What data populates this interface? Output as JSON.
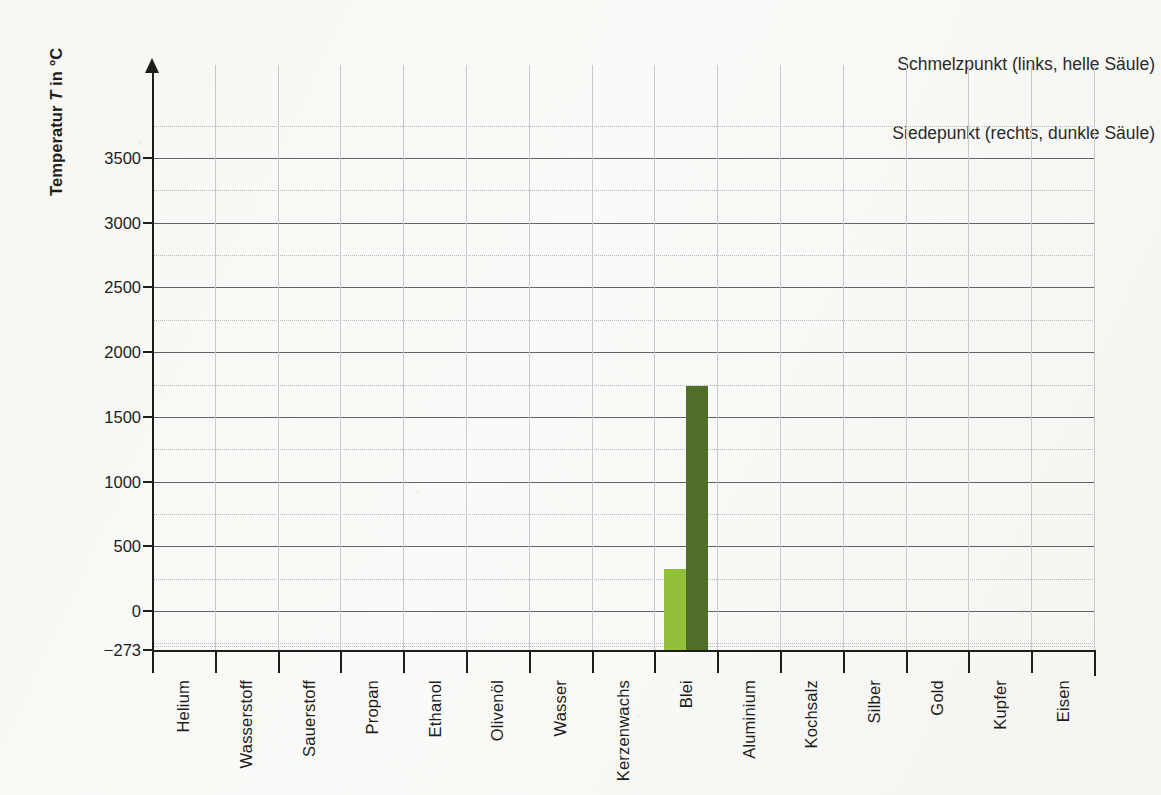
{
  "legend": {
    "line1": "Schmelzpunkt (links, helle Säule)",
    "line2": "Siedepunkt (rechts, dunkle Säule)"
  },
  "axis": {
    "y_title_prefix": "Temperatur ",
    "y_title_symbol": "T",
    "y_title_suffix": " in °C"
  },
  "colors": {
    "melting_bar": "#93c03c",
    "boiling_bar": "#4f6f28",
    "axis": "#1d1d1b",
    "gridline_major": "#63636a",
    "gridline_minor": "#b9b9bd",
    "gridline_vertical": "#c9c9cd",
    "paper": "#f7f7f5"
  },
  "chart_data": {
    "type": "bar",
    "title": "",
    "subtitle": "",
    "xlabel": "",
    "ylabel": "Temperatur T in °C",
    "ylim": [
      -273,
      3750
    ],
    "yticks": [
      -273,
      0,
      500,
      1000,
      1500,
      2000,
      2500,
      3000,
      3500
    ],
    "ytick_labels": [
      "−273",
      "0",
      "500",
      "1000",
      "1500",
      "2000",
      "2500",
      "3000",
      "3500"
    ],
    "y_minor_step": 250,
    "grid": true,
    "legend_position": "top-right",
    "categories": [
      "Helium",
      "Wasserstoff",
      "Sauerstoff",
      "Propan",
      "Ethanol",
      "Olivenöl",
      "Wasser",
      "Kerzenwachs",
      "Blei",
      "Aluminium",
      "Kochsalz",
      "Silber",
      "Gold",
      "Kupfer",
      "Eisen"
    ],
    "series": [
      {
        "name": "Schmelzpunkt (links, helle Säule)",
        "color": "#93c03c",
        "values": [
          null,
          null,
          null,
          null,
          null,
          null,
          null,
          null,
          327,
          null,
          null,
          null,
          null,
          null,
          null
        ]
      },
      {
        "name": "Siedepunkt (rechts, dunkle Säule)",
        "color": "#4f6f28",
        "values": [
          null,
          null,
          null,
          null,
          null,
          null,
          null,
          null,
          1740,
          null,
          null,
          null,
          null,
          null,
          null
        ]
      }
    ]
  }
}
